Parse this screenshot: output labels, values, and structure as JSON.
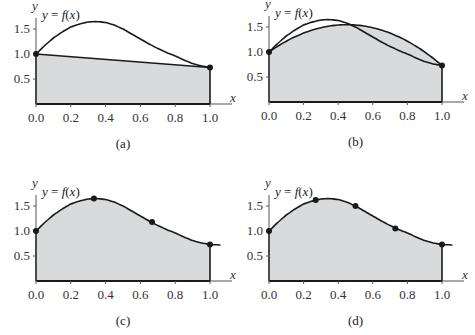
{
  "chart_data": [
    {
      "id": "a",
      "type": "area",
      "caption": "(a)",
      "title": "",
      "function_label": "y = f(x)",
      "xlabel": "x",
      "ylabel": "y",
      "xlim": [
        0.0,
        1.0
      ],
      "ylim": [
        0.0,
        1.7
      ],
      "x_ticks": [
        "0.0",
        "0.2",
        "0.4",
        "0.6",
        "0.8",
        "1.0"
      ],
      "y_ticks": [
        "0.5",
        "1.0",
        "1.5"
      ],
      "method": "trapezoid, n=1",
      "nodes": [
        [
          0.0,
          1.0
        ],
        [
          1.0,
          0.73
        ]
      ],
      "approximation": "linear",
      "grid": false
    },
    {
      "id": "b",
      "type": "area",
      "caption": "(b)",
      "title": "",
      "function_label": "y = f(x)",
      "xlabel": "x",
      "ylabel": "y",
      "xlim": [
        0.0,
        1.0
      ],
      "ylim": [
        0.0,
        1.7
      ],
      "x_ticks": [
        "0.0",
        "0.2",
        "0.4",
        "0.6",
        "0.8",
        "1.0"
      ],
      "y_ticks": [
        "0.5",
        "1.0",
        "1.5"
      ],
      "method": "quadratic through endpoints",
      "nodes": [
        [
          0.0,
          1.0
        ],
        [
          1.0,
          0.73
        ]
      ],
      "approximation": "quadratic, peak ≈ 1.53 at x ≈ 0.45",
      "grid": false
    },
    {
      "id": "c",
      "type": "area",
      "caption": "(c)",
      "title": "",
      "function_label": "y = f(x)",
      "xlabel": "x",
      "ylabel": "y",
      "xlim": [
        0.0,
        1.0
      ],
      "ylim": [
        0.0,
        1.7
      ],
      "x_ticks": [
        "0.0",
        "0.2",
        "0.4",
        "0.6",
        "0.8",
        "1.0"
      ],
      "y_ticks": [
        "0.5",
        "1.0",
        "1.5"
      ],
      "method": "n=3 nodes",
      "nodes": [
        [
          0.0,
          1.0
        ],
        [
          0.333,
          1.65
        ],
        [
          0.667,
          1.18
        ],
        [
          1.0,
          0.73
        ]
      ],
      "approximation": "piecewise close to f",
      "grid": false
    },
    {
      "id": "d",
      "type": "area",
      "caption": "(d)",
      "title": "",
      "function_label": "y = f(x)",
      "xlabel": "x",
      "ylabel": "y",
      "xlim": [
        0.0,
        1.0
      ],
      "ylim": [
        0.0,
        1.7
      ],
      "x_ticks": [
        "0.0",
        "0.2",
        "0.4",
        "0.6",
        "0.8",
        "1.0"
      ],
      "y_ticks": [
        "0.5",
        "1.0",
        "1.5"
      ],
      "method": "n=4 nodes",
      "nodes": [
        [
          0.0,
          1.0
        ],
        [
          0.27,
          1.62
        ],
        [
          0.5,
          1.5
        ],
        [
          0.73,
          1.05
        ],
        [
          1.0,
          0.73
        ]
      ],
      "approximation": "piecewise close to f",
      "grid": false
    }
  ],
  "curve": {
    "x": [
      0.0,
      0.05,
      0.1,
      0.15,
      0.2,
      0.25,
      0.3,
      0.35,
      0.4,
      0.45,
      0.5,
      0.55,
      0.6,
      0.65,
      0.7,
      0.75,
      0.8,
      0.85,
      0.9,
      0.95,
      1.0,
      1.06
    ],
    "y": [
      1.0,
      1.17,
      1.32,
      1.44,
      1.54,
      1.6,
      1.64,
      1.65,
      1.63,
      1.58,
      1.5,
      1.4,
      1.3,
      1.2,
      1.11,
      1.03,
      0.96,
      0.88,
      0.81,
      0.76,
      0.73,
      0.72
    ]
  },
  "colors": {
    "fill": "#d9dadb",
    "line": "#1a1a1a",
    "axis": "#555555"
  }
}
